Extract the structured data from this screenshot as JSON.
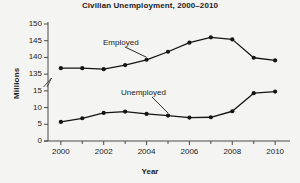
{
  "chart_data": {
    "type": "line",
    "title": "Civilian Unemployment, 2000–2010",
    "xlabel": "Year",
    "ylabel": "Millions",
    "x": [
      2000,
      2001,
      2002,
      2003,
      2004,
      2005,
      2006,
      2007,
      2008,
      2009,
      2010
    ],
    "xtick_labels": [
      "2000",
      "2002",
      "2004",
      "2006",
      "2008",
      "2010"
    ],
    "xtick_values": [
      2000,
      2002,
      2004,
      2006,
      2008,
      2010
    ],
    "xlim": [
      1999.4,
      2010.6
    ],
    "ytick_labels": [
      "0",
      "5",
      "10",
      "15",
      "135",
      "140",
      "145",
      "150"
    ],
    "ytick_values": [
      0,
      5,
      10,
      15,
      135,
      140,
      145,
      150
    ],
    "axis_break": {
      "present": true,
      "between": [
        15,
        135
      ],
      "symbol": "double-slash"
    },
    "grid": false,
    "legend_position": "inline-annotations",
    "series": [
      {
        "name": "Employed",
        "values": [
          136.8,
          136.8,
          136.5,
          137.7,
          139.3,
          141.7,
          144.4,
          146.0,
          145.4,
          139.9,
          139.1
        ]
      },
      {
        "name": "Unemployed",
        "values": [
          5.7,
          6.8,
          8.4,
          8.8,
          8.1,
          7.6,
          7.0,
          7.1,
          8.9,
          14.3,
          14.8
        ]
      }
    ],
    "annotations": [
      {
        "text": "Employed",
        "points_to_year": 2004
      },
      {
        "text": "Unemployed",
        "points_to_year": 2005
      }
    ],
    "colors": {
      "line": "#151515",
      "marker": "#151515",
      "axis": "#4a4a4a",
      "text": "#1b1b1b",
      "background": "#f4f4f2"
    }
  }
}
